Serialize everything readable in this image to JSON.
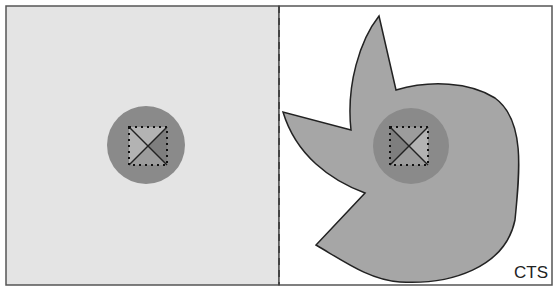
{
  "figure": {
    "label": "CTS",
    "colors": {
      "left_panel_fill": "#e4e4e4",
      "right_panel_fill": "#ffffff",
      "hand_fill": "#a6a6a6",
      "circle_fill": "#8a8a8a",
      "tri_light": "#b3b3b3",
      "tri_mid": "#9c9c9c",
      "tri_dark": "#7e7e7e",
      "border": "#555555",
      "line": "#222222"
    },
    "left_panel": {
      "description": "Uniform light field with central circle containing dotted square split by diagonals"
    },
    "right_panel": {
      "description": "Irregular pinwheel/claw-shaped grey region surrounding the central circle with dotted square split by diagonals"
    },
    "divider": {
      "style": "dashed"
    }
  }
}
